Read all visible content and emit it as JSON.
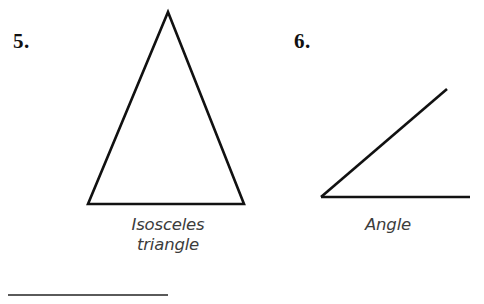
{
  "page": {
    "background_color": "#ffffff",
    "width": 484,
    "height": 304,
    "ink_color": "#111111",
    "caption_color": "#3c3c3c",
    "rule_color": "#5a5a5a"
  },
  "exercises": [
    {
      "number": "5.",
      "figure_name": "isosceles-triangle",
      "caption": "Isosceles\ntriangle",
      "caption_line_1": "Isosceles",
      "caption_line_2": "triangle",
      "geometry": {
        "shape": "triangle",
        "apex": [
          168,
          12
        ],
        "base_left": [
          88,
          204
        ],
        "base_right": [
          244,
          204
        ],
        "stroke_width": 2.6
      }
    },
    {
      "number": "6.",
      "figure_name": "angle",
      "caption": "Angle",
      "caption_line_1": "Angle",
      "geometry": {
        "shape": "angle",
        "vertex": [
          321,
          197
        ],
        "ray_horizontal_end": [
          470,
          197
        ],
        "ray_slanted_end": [
          447,
          89
        ],
        "stroke_width": 2.6
      }
    }
  ],
  "divider": {
    "name": "bottom-rule",
    "x_start": 8,
    "x_end": 168,
    "y": 295,
    "thickness": 2
  }
}
